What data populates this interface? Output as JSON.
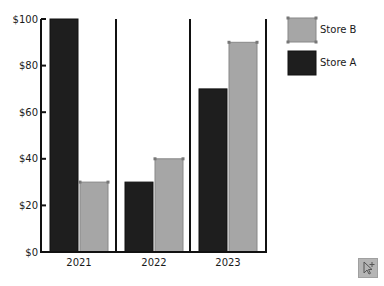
{
  "chart_data": {
    "type": "bar",
    "title": "",
    "xlabel": "",
    "ylabel": "",
    "categories": [
      "2021",
      "2022",
      "2023"
    ],
    "series": [
      {
        "name": "Store A",
        "color": "#1e1e1e",
        "values": [
          100,
          30,
          70
        ]
      },
      {
        "name": "Store B",
        "color": "#a6a6a6",
        "values": [
          30,
          40,
          90
        ]
      }
    ],
    "ylim": [
      0,
      100
    ],
    "yticks": [
      0,
      20,
      40,
      60,
      80,
      100
    ],
    "ytick_labels": [
      "$0",
      "$20",
      "$40",
      "$60",
      "$80",
      "$100"
    ],
    "grid": false,
    "legend_position": "top-right",
    "legend_order": [
      "Store B",
      "Store A"
    ]
  },
  "toolbar": {
    "icon": "cursor-plus-icon"
  }
}
